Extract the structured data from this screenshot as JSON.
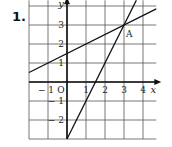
{
  "problem_number": "1.",
  "chart_data": {
    "type": "line",
    "title": "",
    "xlabel": "x",
    "ylabel": "y",
    "origin_label": "O",
    "xlim": [
      -2,
      4.7
    ],
    "ylim": [
      -3,
      4.3
    ],
    "grid": true,
    "x_ticks": [
      -1,
      1,
      2,
      3,
      4
    ],
    "x_tick_labels": [
      "− 1",
      "1",
      "2",
      "3",
      "4"
    ],
    "y_ticks": [
      3,
      2,
      1,
      -1,
      -2
    ],
    "y_tick_labels": [
      "3",
      "2",
      "1",
      "− 1",
      "− 2"
    ],
    "series": [
      {
        "name": "line-1",
        "equation": "y = 0.5x + 1.5",
        "x": [
          -2,
          4.7
        ],
        "y": [
          0.5,
          3.85
        ]
      },
      {
        "name": "line-2",
        "equation": "y = 2x - 3",
        "x": [
          0,
          3.65
        ],
        "y": [
          -3,
          4.3
        ]
      }
    ],
    "annotations": [
      {
        "label": "A",
        "x": 3,
        "y": 3
      }
    ]
  }
}
